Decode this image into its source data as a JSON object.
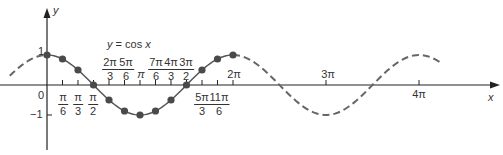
{
  "chart_data": {
    "type": "line",
    "title": "y = cos x",
    "xlabel": "x",
    "ylabel": "y",
    "function": "cos",
    "xlim_radians": [
      -0.4,
      4.25
    ],
    "xlim_units": "pi",
    "ylim": [
      -1.9,
      2.6
    ],
    "grid": false,
    "legend": null,
    "series": [
      {
        "name": "solid segment (0 to 2π)",
        "style": "solid",
        "x_pi": [
          0,
          2
        ],
        "markers": true
      },
      {
        "name": "dashed extension left",
        "style": "dashed",
        "x_pi": [
          -0.4,
          0
        ]
      },
      {
        "name": "dashed extension right",
        "style": "dashed",
        "x_pi": [
          2,
          4.25
        ]
      }
    ],
    "points": [
      {
        "x": "0",
        "x_pi": 0,
        "y": 1
      },
      {
        "x": "π/6",
        "x_pi": 0.16667,
        "y": 0.866
      },
      {
        "x": "π/3",
        "x_pi": 0.33333,
        "y": 0.5
      },
      {
        "x": "π/2",
        "x_pi": 0.5,
        "y": 0
      },
      {
        "x": "2π/3",
        "x_pi": 0.66667,
        "y": -0.5
      },
      {
        "x": "5π/6",
        "x_pi": 0.83333,
        "y": -0.866
      },
      {
        "x": "π",
        "x_pi": 1,
        "y": -1
      },
      {
        "x": "7π/6",
        "x_pi": 1.16667,
        "y": -0.866
      },
      {
        "x": "4π/3",
        "x_pi": 1.33333,
        "y": -0.5
      },
      {
        "x": "3π/2",
        "x_pi": 1.5,
        "y": 0
      },
      {
        "x": "5π/3",
        "x_pi": 1.66667,
        "y": 0.5
      },
      {
        "x": "11π/6",
        "x_pi": 1.83333,
        "y": 0.866
      },
      {
        "x": "2π",
        "x_pi": 2,
        "y": 1
      }
    ],
    "x_tick_labels": [
      "0",
      "π/6",
      "π/3",
      "π/2",
      "2π/3",
      "5π/6",
      "π",
      "7π/6",
      "4π/3",
      "3π/2",
      "5π/3",
      "11π/6",
      "2π",
      "3π",
      "4π"
    ],
    "y_tick_labels": [
      "1",
      "−1"
    ]
  },
  "labels": {
    "title": "y = cos x",
    "title_y": "y",
    "title_eq": "=",
    "title_rhs_cos": "cos",
    "title_rhs_x": "x",
    "x_axis": "x",
    "y_axis": "y",
    "origin": "0",
    "y_one": "1",
    "y_neg_one": "−1",
    "pi": "π",
    "two_pi": "2π",
    "three_pi": "3π",
    "four_pi": "4π",
    "fractions_below": [
      {
        "num": "π",
        "den": "6"
      },
      {
        "num": "π",
        "den": "3"
      },
      {
        "num": "π",
        "den": "2"
      },
      {
        "num": "5π",
        "den": "3"
      },
      {
        "num": "11π",
        "den": "6"
      }
    ],
    "fractions_above": [
      {
        "num": "2π",
        "den": "3"
      },
      {
        "num": "5π",
        "den": "6"
      },
      {
        "num": "7π",
        "den": "6"
      },
      {
        "num": "4π",
        "den": "3"
      },
      {
        "num": "3π",
        "den": "2"
      }
    ]
  },
  "colors": {
    "axis": "#222222",
    "curve": "#555555",
    "marker": "#4a4a4a",
    "text": "#333333"
  }
}
